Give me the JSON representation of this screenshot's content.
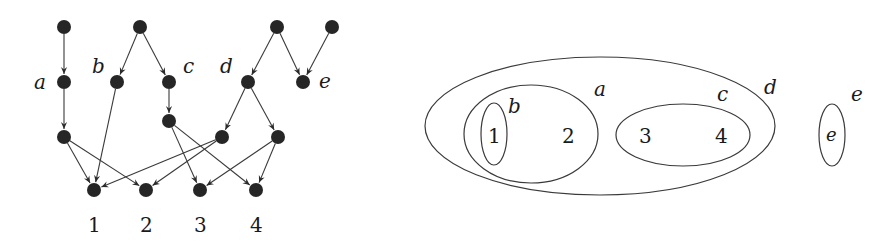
{
  "left_graph": {
    "nodes": [
      {
        "id": "t1",
        "x": 64,
        "y": 27
      },
      {
        "id": "t2",
        "x": 140,
        "y": 27
      },
      {
        "id": "t3",
        "x": 277,
        "y": 27
      },
      {
        "id": "t4",
        "x": 332,
        "y": 27
      },
      {
        "id": "a",
        "x": 64,
        "y": 82,
        "label": "a",
        "lx": 40,
        "ly": 89
      },
      {
        "id": "b",
        "x": 117,
        "y": 82,
        "label": "b",
        "lx": 94,
        "ly": 73
      },
      {
        "id": "c",
        "x": 169,
        "y": 82,
        "label": "c",
        "lx": 184,
        "ly": 73
      },
      {
        "id": "d",
        "x": 248,
        "y": 82,
        "label": "d",
        "lx": 225,
        "ly": 73
      },
      {
        "id": "e",
        "x": 303,
        "y": 82,
        "label": "e",
        "lx": 322,
        "ly": 89
      },
      {
        "id": "a2",
        "x": 64,
        "y": 137
      },
      {
        "id": "c2",
        "x": 169,
        "y": 121
      },
      {
        "id": "d2l",
        "x": 222,
        "y": 137
      },
      {
        "id": "d2r",
        "x": 278,
        "y": 137
      },
      {
        "id": "l1",
        "x": 94,
        "y": 190,
        "label": "1",
        "lx": 94,
        "ly": 232
      },
      {
        "id": "l2",
        "x": 146,
        "y": 190,
        "label": "2",
        "lx": 146,
        "ly": 232
      },
      {
        "id": "l3",
        "x": 200,
        "y": 190,
        "label": "3",
        "lx": 200,
        "ly": 232
      },
      {
        "id": "l4",
        "x": 256,
        "y": 190,
        "label": "4",
        "lx": 256,
        "ly": 232
      }
    ],
    "edges": [
      [
        "t1",
        "a"
      ],
      [
        "t2",
        "b"
      ],
      [
        "t2",
        "c"
      ],
      [
        "t3",
        "d"
      ],
      [
        "t3",
        "e"
      ],
      [
        "t4",
        "e"
      ],
      [
        "a",
        "a2"
      ],
      [
        "c",
        "c2"
      ],
      [
        "d",
        "d2l"
      ],
      [
        "d",
        "d2r"
      ],
      [
        "a2",
        "l1"
      ],
      [
        "a2",
        "l2"
      ],
      [
        "b",
        "l1"
      ],
      [
        "c2",
        "l3"
      ],
      [
        "c2",
        "l4"
      ],
      [
        "d2l",
        "l1"
      ],
      [
        "d2l",
        "l2"
      ],
      [
        "d2r",
        "l3"
      ],
      [
        "d2r",
        "l4"
      ]
    ],
    "labels": {
      "a": "a",
      "b": "b",
      "c": "c",
      "d": "d",
      "e": "e",
      "one": "1",
      "two": "2",
      "three": "3",
      "four": "4"
    }
  },
  "right_venn": {
    "ellipses": [
      {
        "set": "d",
        "cx": 600,
        "cy": 126,
        "rx": 175,
        "ry": 69
      },
      {
        "set": "a",
        "cx": 531,
        "cy": 134,
        "rx": 67,
        "ry": 49
      },
      {
        "set": "b",
        "cx": 494,
        "cy": 134,
        "rx": 13,
        "ry": 31
      },
      {
        "set": "c",
        "cx": 683,
        "cy": 135,
        "rx": 67,
        "ry": 31
      },
      {
        "set": "e",
        "cx": 832,
        "cy": 135,
        "rx": 13,
        "ry": 31
      }
    ],
    "set_labels": {
      "a": {
        "text": "a",
        "x": 600,
        "y": 96
      },
      "b": {
        "text": "b",
        "x": 514,
        "y": 113
      },
      "c": {
        "text": "c",
        "x": 723,
        "y": 101
      },
      "d": {
        "text": "d",
        "x": 771,
        "y": 94
      },
      "e": {
        "text": "e",
        "x": 857,
        "y": 101
      }
    },
    "members": {
      "one": {
        "text": "1",
        "x": 494,
        "y": 143
      },
      "two": {
        "text": "2",
        "x": 568,
        "y": 143
      },
      "three": {
        "text": "3",
        "x": 645,
        "y": 143
      },
      "four": {
        "text": "4",
        "x": 721,
        "y": 143
      },
      "e": {
        "text": "e",
        "x": 832,
        "y": 141
      }
    }
  }
}
